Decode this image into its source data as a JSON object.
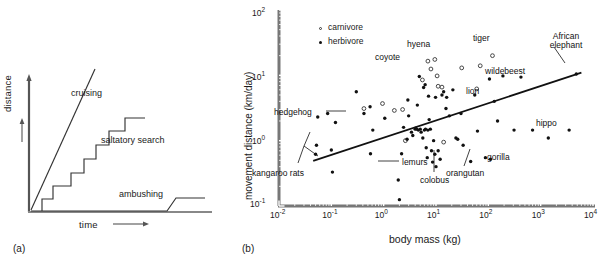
{
  "figure": {
    "panel_a": {
      "tag": "(a)",
      "xlabel": "time",
      "ylabel": "distance",
      "curves": [
        {
          "name": "cruising",
          "label": "cruising"
        },
        {
          "name": "saltatory-search",
          "label": "saltatory search"
        },
        {
          "name": "ambushing",
          "label": "ambushing"
        }
      ]
    },
    "panel_b": {
      "tag": "(b)",
      "xlabel": "body mass (kg)",
      "ylabel": "movement distance (km/day)",
      "legend": [
        {
          "key": "carnivore",
          "label": "carnivore",
          "marker": "open-circle"
        },
        {
          "key": "herbivore",
          "label": "herbivore",
          "marker": "filled-circle"
        }
      ],
      "xticks": [
        "10-2",
        "10-1",
        "100",
        "101",
        "102",
        "103",
        "104"
      ],
      "xtick_exp": [
        "-2",
        "-1",
        "0",
        "1",
        "2",
        "3",
        "4"
      ],
      "ytick_exp": [
        "2",
        "1",
        "0",
        "-1"
      ],
      "annotations": [
        "hedgehog",
        "kangaroo rats",
        "lemurs",
        "colobus",
        "coyote",
        "hyena",
        "tiger",
        "African elephant",
        "wildebeest",
        "lion",
        "hippo",
        "gorilla",
        "orangutan"
      ]
    }
  },
  "chart_data": [
    {
      "type": "line",
      "title": "",
      "xlabel": "time",
      "ylabel": "distance",
      "axes": "qualitative-arrows",
      "grid": false,
      "legend": "inline-labels",
      "series": [
        {
          "name": "cruising",
          "style": "straight-steep-line",
          "points": [
            [
              0,
              0
            ],
            [
              0.52,
              1.0
            ]
          ]
        },
        {
          "name": "saltatory search",
          "style": "staircase",
          "points": [
            [
              0.06,
              0
            ],
            [
              0.06,
              0.09
            ],
            [
              0.21,
              0.09
            ],
            [
              0.21,
              0.23
            ],
            [
              0.34,
              0.23
            ],
            [
              0.34,
              0.38
            ],
            [
              0.46,
              0.38
            ],
            [
              0.46,
              0.52
            ],
            [
              0.58,
              0.52
            ],
            [
              0.58,
              0.67
            ],
            [
              0.72,
              0.67
            ],
            [
              0.72,
              0.8
            ],
            [
              0.88,
              0.8
            ]
          ]
        },
        {
          "name": "ambushing",
          "style": "flat-then-step",
          "points": [
            [
              0.0,
              0.0
            ],
            [
              0.7,
              0.0
            ],
            [
              0.76,
              0.09
            ],
            [
              0.98,
              0.09
            ]
          ]
        }
      ]
    },
    {
      "type": "scatter",
      "title": "",
      "xlabel": "body mass (kg)",
      "ylabel": "movement distance (km/day)",
      "xscale": "log",
      "yscale": "log",
      "xlim": [
        0.01,
        10000
      ],
      "ylim": [
        0.1,
        100
      ],
      "grid": false,
      "legend_position": "top-left",
      "trendline": {
        "name": "regression",
        "x": [
          0.045,
          6000
        ],
        "y": [
          0.49,
          11.0
        ]
      },
      "series": [
        {
          "name": "carnivore",
          "marker": "open-circle",
          "points": [
            [
              0.95,
              3.7
            ],
            [
              2.3,
              3.0
            ],
            [
              5.5,
              8.5
            ],
            [
              7.0,
              16.5
            ],
            [
              9.5,
              17.5
            ],
            [
              8.0,
              12.5
            ],
            [
              10.5,
              9.8
            ],
            [
              11.0,
              6.8
            ],
            [
              13.0,
              6.6
            ],
            [
              31.0,
              13.0
            ],
            [
              120.0,
              20.0
            ],
            [
              60.0,
              6.2
            ],
            [
              70.0,
              14.0
            ],
            [
              0.42,
              3.1
            ],
            [
              1.6,
              2.9
            ],
            [
              2.6,
              1.0
            ],
            [
              14.0,
              0.95
            ]
          ]
        },
        {
          "name": "herbivore",
          "marker": "filled-circle",
          "points": [
            [
              0.05,
              0.62
            ],
            [
              0.052,
              0.85
            ],
            [
              0.1,
              0.72
            ],
            [
              0.105,
              0.33
            ],
            [
              0.055,
              2.3
            ],
            [
              0.085,
              2.6
            ],
            [
              0.12,
              1.9
            ],
            [
              0.55,
              3.3
            ],
            [
              0.56,
              0.63
            ],
            [
              0.62,
              1.45
            ],
            [
              1.05,
              2.2
            ],
            [
              0.42,
              2.6
            ],
            [
              1.9,
              0.25
            ],
            [
              2.0,
              0.125
            ],
            [
              2.2,
              0.63
            ],
            [
              2.4,
              1.6
            ],
            [
              2.8,
              1.05
            ],
            [
              3.0,
              2.4
            ],
            [
              3.4,
              1.35
            ],
            [
              3.6,
              1.2
            ],
            [
              4.0,
              1.5
            ],
            [
              4.1,
              1.55
            ],
            [
              4.3,
              1.5
            ],
            [
              4.6,
              1.45
            ],
            [
              5.0,
              1.5
            ],
            [
              5.2,
              1.35
            ],
            [
              5.6,
              1.1
            ],
            [
              6.0,
              1.45
            ],
            [
              6.3,
              1.5
            ],
            [
              6.5,
              0.78
            ],
            [
              6.8,
              0.55
            ],
            [
              7.0,
              1.45
            ],
            [
              7.4,
              2.1
            ],
            [
              7.8,
              1.5
            ],
            [
              8.2,
              0.7
            ],
            [
              8.6,
              0.47
            ],
            [
              9.0,
              1.0
            ],
            [
              9.5,
              0.62
            ],
            [
              10.0,
              0.4
            ],
            [
              11.0,
              0.7
            ],
            [
              12.0,
              0.52
            ],
            [
              13.0,
              5.0
            ],
            [
              14.0,
              5.6
            ],
            [
              15.5,
              3.1
            ],
            [
              18.0,
              2.4
            ],
            [
              21.0,
              6.0
            ],
            [
              24.0,
              1.1
            ],
            [
              26.0,
              1.05
            ],
            [
              30.0,
              2.6
            ],
            [
              33.0,
              0.85
            ],
            [
              46.0,
              0.48
            ],
            [
              55.0,
              5.0
            ],
            [
              62.0,
              1.4
            ],
            [
              88.0,
              0.55
            ],
            [
              105.0,
              8.8
            ],
            [
              110.0,
              0.52
            ],
            [
              130.0,
              4.0
            ],
            [
              150.0,
              2.0
            ],
            [
              190.0,
              9.8
            ],
            [
              310.0,
              1.45
            ],
            [
              420.0,
              9.4
            ],
            [
              700.0,
              1.45
            ],
            [
              1400.0,
              1.1
            ],
            [
              3500.0,
              1.45
            ],
            [
              4800.0,
              10.5
            ],
            [
              0.3,
              5.6
            ],
            [
              5.8,
              6.5
            ],
            [
              6.2,
              7.2
            ],
            [
              4.8,
              9.6
            ],
            [
              7.2,
              4.8
            ],
            [
              9.8,
              4.6
            ],
            [
              16.0,
              4.6
            ],
            [
              2.9,
              4.2
            ],
            [
              4.4,
              3.5
            ]
          ]
        }
      ],
      "annotations": [
        {
          "text": "hedgehog",
          "x": 0.18,
          "y": 2.2,
          "anchor": "right",
          "leader": true
        },
        {
          "text": "kangaroo rats",
          "x": 0.055,
          "y": 0.22,
          "anchor": "left",
          "leader": true
        },
        {
          "text": "lemurs",
          "x": 2.6,
          "y": 0.23,
          "anchor": "left",
          "leader": true
        },
        {
          "text": "colobus",
          "x": 7.5,
          "y": 0.155,
          "anchor": "center",
          "leader": true
        },
        {
          "text": "coyote",
          "x": 4.4,
          "y": 14.5,
          "anchor": "right",
          "leader": false
        },
        {
          "text": "hyena",
          "x": 8.0,
          "y": 25.0,
          "anchor": "center",
          "leader": false
        },
        {
          "text": "tiger",
          "x": 120.0,
          "y": 30.0,
          "anchor": "center",
          "leader": false
        },
        {
          "text": "African elephant",
          "x": 4000.0,
          "y": 33.0,
          "anchor": "center",
          "leader": true
        },
        {
          "text": "wildebeest",
          "x": 230.0,
          "y": 9.8,
          "anchor": "left",
          "leader": false
        },
        {
          "text": "lion",
          "x": 75.0,
          "y": 6.0,
          "anchor": "left",
          "leader": false
        },
        {
          "text": "hippo",
          "x": 1600.0,
          "y": 1.9,
          "anchor": "center",
          "leader": false
        },
        {
          "text": "gorilla",
          "x": 150.0,
          "y": 0.5,
          "anchor": "left",
          "leader": false
        },
        {
          "text": "orangutan",
          "x": 60.0,
          "y": 0.26,
          "anchor": "center",
          "leader": true
        }
      ]
    }
  ]
}
